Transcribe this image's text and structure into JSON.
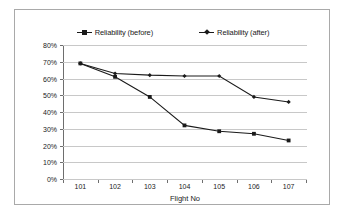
{
  "chart_data": {
    "type": "line",
    "title": "",
    "xlabel": "Flight No",
    "ylabel": "",
    "categories": [
      "101",
      "102",
      "103",
      "104",
      "105",
      "106",
      "107"
    ],
    "ytick_labels": [
      "0%",
      "10%",
      "20%",
      "30%",
      "40%",
      "50%",
      "60%",
      "70%",
      "80%"
    ],
    "ytick_values": [
      0,
      10,
      20,
      30,
      40,
      50,
      60,
      70,
      80
    ],
    "ylim": [
      0,
      80
    ],
    "grid": true,
    "legend_position": "top",
    "series": [
      {
        "name": "Reliability (before)",
        "marker": "square",
        "values": [
          69,
          61,
          49,
          32,
          28.5,
          27,
          23
        ]
      },
      {
        "name": "Reliability (after)",
        "marker": "diamond",
        "values": [
          69,
          63,
          62,
          61.5,
          61.5,
          49,
          46
        ]
      }
    ]
  },
  "legend": {
    "entries": [
      {
        "label": "Reliability (before)"
      },
      {
        "label": "Reliability (after)"
      }
    ]
  },
  "axis": {
    "x_title": "Flight No"
  }
}
